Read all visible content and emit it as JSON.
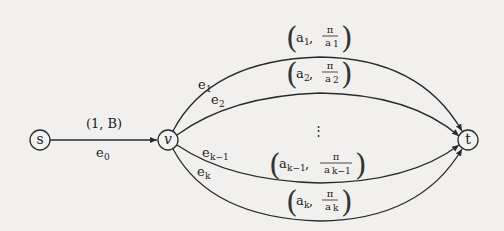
{
  "diagram": {
    "type": "directed-graph",
    "nodes": [
      {
        "id": "s",
        "label": "s",
        "x": 40,
        "y": 140
      },
      {
        "id": "v",
        "label": "v",
        "x": 168,
        "y": 140
      },
      {
        "id": "t",
        "label": "t",
        "x": 468,
        "y": 140
      }
    ],
    "edges": [
      {
        "id": "e0",
        "from": "s",
        "to": "v",
        "name": "e",
        "name_sub": "0",
        "weight_label": "(1, B)"
      },
      {
        "id": "e1",
        "from": "v",
        "to": "t",
        "name": "e",
        "name_sub": "1",
        "pair_main": "a",
        "pair_sub": "1",
        "frac_num": "π",
        "frac_den": "a",
        "frac_den_sub": "1"
      },
      {
        "id": "e2",
        "from": "v",
        "to": "t",
        "name": "e",
        "name_sub": "2",
        "pair_main": "a",
        "pair_sub": "2",
        "frac_num": "π",
        "frac_den": "a",
        "frac_den_sub": "2"
      },
      {
        "id": "ek-1",
        "from": "v",
        "to": "t",
        "name": "e",
        "name_sub": "k−1",
        "pair_main": "a",
        "pair_sub": "k−1",
        "frac_num": "π",
        "frac_den": "a",
        "frac_den_sub": "k−1"
      },
      {
        "id": "ek",
        "from": "v",
        "to": "t",
        "name": "e",
        "name_sub": "k",
        "pair_main": "a",
        "pair_sub": "k",
        "frac_num": "π",
        "frac_den": "a",
        "frac_den_sub": "k"
      }
    ],
    "ellipsis": "⋮",
    "comma": ","
  }
}
